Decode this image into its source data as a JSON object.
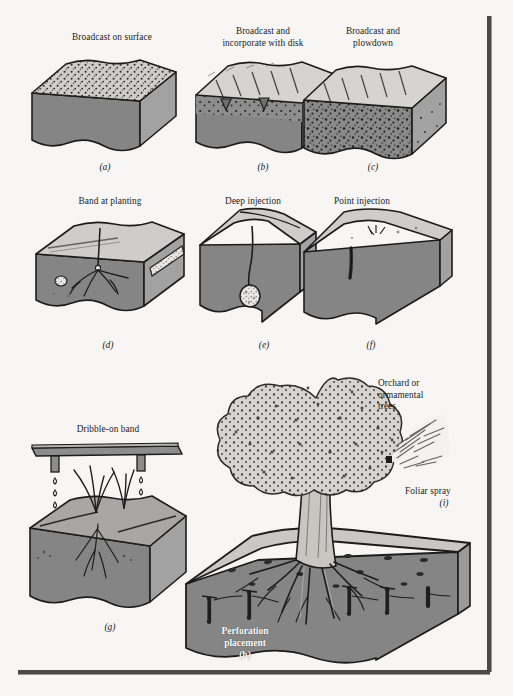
{
  "figure": {
    "background_color": "#f7f6f4",
    "rule_color": "#4a4a4a"
  },
  "palette": {
    "soil_front": "#858585",
    "soil_side": "#a2a2a2",
    "soil_top": "#cdcdcd",
    "soil_top_light": "#d8d6d2",
    "outline": "#1c1c1c",
    "speckle": "#2a2a2a",
    "granule": "#e8e6e2",
    "canopy": "#d5d3cf",
    "trunk": "#c9c6c1",
    "caption": "#1a1a1a",
    "caption_inverse": "#ffffff"
  },
  "panels": [
    {
      "id": "a",
      "letter": "(a)",
      "label": "Broadcast on surface",
      "description": "Soil block with fertilizer granules scattered across the top surface only"
    },
    {
      "id": "b",
      "letter": "(b)",
      "label": "Broadcast and\nincorporate with disk",
      "description": "Soil block with disk furrows and fertilizer mixed into the shallow tilled layer"
    },
    {
      "id": "c",
      "letter": "(c)",
      "label": "Broadcast and\nplowdown",
      "description": "Soil block with fertilizer mixed deeply throughout the plow layer"
    },
    {
      "id": "d",
      "letter": "(d)",
      "label": "Band at planting",
      "description": "Soil block with seedling, root system, and a granular fertilizer band beside the row"
    },
    {
      "id": "e",
      "letter": "(e)",
      "label": "Deep injection",
      "description": "Soil block with a narrow slit channel leading to a deep fertilizer pocket"
    },
    {
      "id": "f",
      "letter": "(f)",
      "label": "Point injection",
      "description": "Soil block with a short vertical injection point near the surface"
    },
    {
      "id": "g",
      "letter": "(g)",
      "label": "Dribble-on band",
      "description": "Boom bar with two nozzles dribbling liquid fertilizer onto banded rows beside grass plants"
    },
    {
      "id": "h",
      "letter": "(h)",
      "label": "Perforation\nplacement",
      "label_style": "inverse",
      "description": "Tree with spreading roots in a soil block containing vertical perforation holes filled with fertilizer"
    },
    {
      "id": "i",
      "letter": "(i)",
      "label": "Foliar spray",
      "description": "Spray cone directed at the tree canopy"
    }
  ],
  "annotations": {
    "orchard_trees": "Orchard or\normamental\ntrees"
  }
}
